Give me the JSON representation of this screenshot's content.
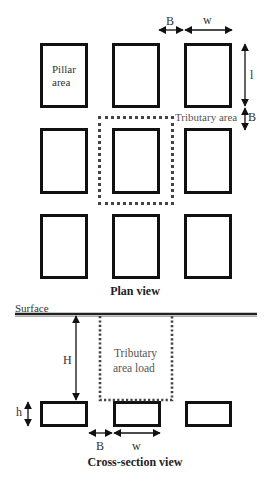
{
  "plan_view": {
    "title": "Plan view",
    "pillar_label": "Pillar area",
    "pillar_label_line1": "Pillar",
    "pillar_label_line2": "area",
    "tributary_label": "Tributary area",
    "dimensions": {
      "top_gap": "B",
      "top_width": "w",
      "side_length": "l",
      "side_gap": "B"
    },
    "grid": {
      "rows": 3,
      "cols": 3
    }
  },
  "cross_section_view": {
    "title": "Cross-section view",
    "surface_label": "Surface",
    "tributary_load_line1": "Tributary",
    "tributary_load_line2": "area load",
    "dimensions": {
      "depth": "H",
      "height": "h",
      "gap": "B",
      "width": "w"
    },
    "pillar_count": 3
  },
  "colors": {
    "outline": "#111111",
    "dotted": "#444444",
    "text": "#333333"
  }
}
